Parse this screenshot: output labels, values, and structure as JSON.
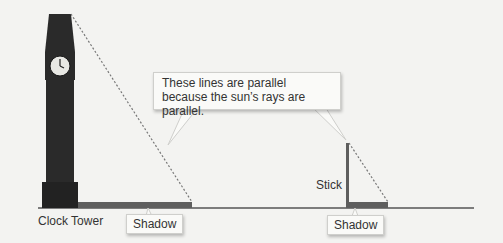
{
  "diagram": {
    "callout_text": "These lines are parallel because the sun’s rays are parallel.",
    "labels": {
      "clock_tower": "Clock Tower",
      "stick": "Stick",
      "shadow_left": "Shadow",
      "shadow_right": "Shadow"
    },
    "colors": {
      "tower": "#2a2a2a",
      "shadow_bar": "#5e5e5e",
      "ground": "#555555",
      "ray": "#777777",
      "background": "#f3f3f1"
    }
  }
}
